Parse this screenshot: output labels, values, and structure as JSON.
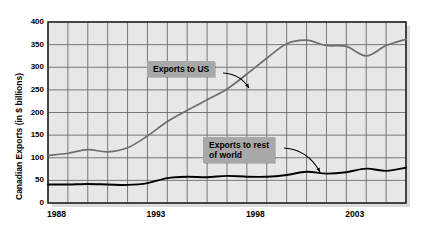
{
  "chart_data": {
    "type": "line",
    "title": "",
    "xlabel": "",
    "ylabel": "Canadian Exports (in $ billions)",
    "xlim": [
      1988,
      2006
    ],
    "ylim": [
      0,
      400
    ],
    "yticks": [
      0,
      50,
      100,
      150,
      200,
      250,
      300,
      350,
      400
    ],
    "xticks": [
      1988,
      1993,
      1998,
      2003
    ],
    "xtick_labels": [
      "1988",
      "1993",
      "1998",
      "2003"
    ],
    "ytick_labels": [
      "0",
      "50",
      "100",
      "150",
      "200",
      "250",
      "300",
      "350",
      "400"
    ],
    "grid": true,
    "legend": "annotations",
    "x": [
      1988,
      1989,
      1990,
      1991,
      1992,
      1993,
      1994,
      1995,
      1996,
      1997,
      1998,
      1999,
      2000,
      2001,
      2002,
      2003,
      2004,
      2005,
      2006
    ],
    "series": [
      {
        "name": "Exports to US",
        "color": "#6e6e6e",
        "values": [
          105,
          110,
          118,
          113,
          122,
          148,
          180,
          205,
          228,
          252,
          285,
          320,
          352,
          360,
          348,
          346,
          325,
          348,
          362
        ]
      },
      {
        "name": "Exports to rest of world",
        "color": "#000000",
        "values": [
          41,
          41,
          42,
          41,
          40,
          44,
          55,
          58,
          57,
          60,
          58,
          58,
          62,
          69,
          65,
          68,
          76,
          71,
          78
        ]
      }
    ],
    "annotations": [
      {
        "text": "Exports to US",
        "target_series": "Exports to US",
        "x_px": 147,
        "y_px": 61,
        "arrow_from_x": 223,
        "arrow_from_y": 73,
        "arrow_to_x": 249,
        "arrow_to_y": 88
      },
      {
        "text": "Exports to rest\nof world",
        "target_series": "Exports to rest of world",
        "x_px": 203,
        "y_px": 137,
        "arrow_from_x": 284,
        "arrow_from_y": 148,
        "arrow_to_x": 320,
        "arrow_to_y": 172
      }
    ]
  },
  "plot": {
    "bg_color": "#e7e7e7",
    "grid_color": "#6b6b6b",
    "border_color": "#2a2a2a",
    "annotation_bg": "#a8a8a8"
  }
}
